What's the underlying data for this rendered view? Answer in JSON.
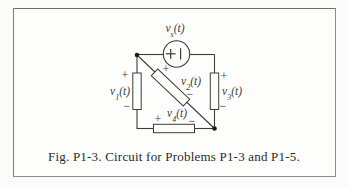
{
  "figure": {
    "caption": "Fig. P1-3. Circuit for Problems P1-3 and P1-5."
  },
  "source": {
    "base": "v",
    "sub": "s",
    "suffix": "(t)",
    "plus": "+",
    "bar": "|"
  },
  "elements": {
    "v1": {
      "base": "v",
      "sub": "1",
      "suffix": "(t)",
      "plus": "+",
      "minus": "−"
    },
    "v2": {
      "base": "v",
      "sub": "2",
      "suffix": "(t)",
      "plus": "+",
      "minus": "−"
    },
    "v3": {
      "base": "v",
      "sub": "3",
      "suffix": "(t)",
      "plus": "+",
      "minus": "−"
    },
    "v4": {
      "base": "v",
      "sub": "4",
      "suffix": "(t)",
      "plus": "+",
      "minus": "−"
    }
  }
}
